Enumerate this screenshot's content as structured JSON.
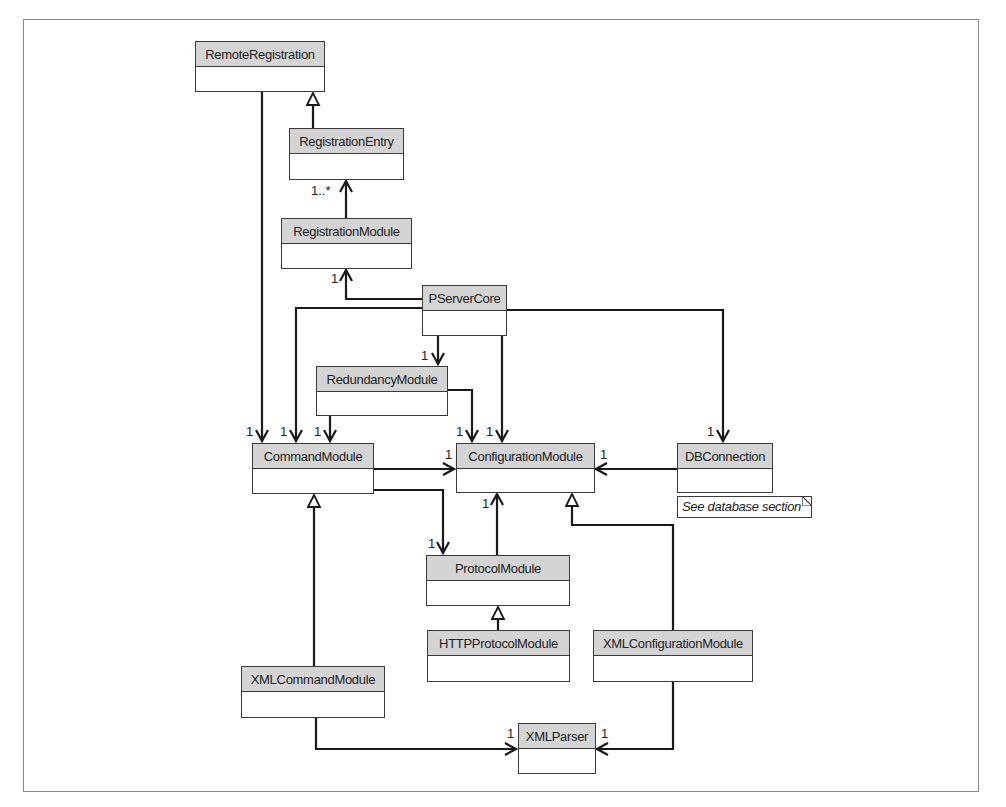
{
  "diagram": {
    "type": "uml-class-diagram",
    "classes": {
      "remote_registration": "RemoteRegistration",
      "registration_entry": "RegistrationEntry",
      "registration_module": "RegistrationModule",
      "pserver_core": "PServerCore",
      "redundancy_module": "RedundancyModule",
      "command_module": "CommandModule",
      "configuration_module": "ConfigurationModule",
      "db_connection": "DBConnection",
      "protocol_module": "ProtocolModule",
      "http_protocol_module": "HTTPProtocolModule",
      "xml_configuration_module": "XMLConfigurationModule",
      "xml_command_module": "XMLCommandModule",
      "xml_parser": "XMLParser"
    },
    "note": {
      "text": "See database section",
      "attached_to": "DBConnection"
    },
    "multiplicities": {
      "registration_entry": "1..*",
      "registration_module": "1",
      "redundancy_module": "1",
      "command_from_remote": "1",
      "command_from_core": "1",
      "command_from_redundancy": "1",
      "config_from_redundancy": "1",
      "config_from_core": "1",
      "config_from_command": "1",
      "config_from_db": "1",
      "config_from_protocol": "1",
      "db_connection": "1",
      "protocol_module": "1",
      "xml_parser_left": "1",
      "xml_parser_right": "1"
    },
    "relationships": [
      {
        "from": "RegistrationEntry",
        "to": "RemoteRegistration",
        "kind": "generalization"
      },
      {
        "from": "RegistrationModule",
        "to": "RegistrationEntry",
        "kind": "association",
        "multiplicity": "1..*"
      },
      {
        "from": "PServerCore",
        "to": "RegistrationModule",
        "kind": "association",
        "multiplicity": "1"
      },
      {
        "from": "RemoteRegistration",
        "to": "CommandModule",
        "kind": "association",
        "multiplicity": "1"
      },
      {
        "from": "PServerCore",
        "to": "CommandModule",
        "kind": "association",
        "multiplicity": "1"
      },
      {
        "from": "PServerCore",
        "to": "RedundancyModule",
        "kind": "association",
        "multiplicity": "1"
      },
      {
        "from": "PServerCore",
        "to": "ConfigurationModule",
        "kind": "association",
        "multiplicity": "1"
      },
      {
        "from": "PServerCore",
        "to": "DBConnection",
        "kind": "association",
        "multiplicity": "1"
      },
      {
        "from": "RedundancyModule",
        "to": "CommandModule",
        "kind": "association",
        "multiplicity": "1"
      },
      {
        "from": "RedundancyModule",
        "to": "ConfigurationModule",
        "kind": "association",
        "multiplicity": "1"
      },
      {
        "from": "CommandModule",
        "to": "ConfigurationModule",
        "kind": "association",
        "multiplicity": "1"
      },
      {
        "from": "CommandModule",
        "to": "ProtocolModule",
        "kind": "association",
        "multiplicity": "1"
      },
      {
        "from": "DBConnection",
        "to": "ConfigurationModule",
        "kind": "association",
        "multiplicity": "1"
      },
      {
        "from": "ProtocolModule",
        "to": "ConfigurationModule",
        "kind": "association",
        "multiplicity": "1"
      },
      {
        "from": "HTTPProtocolModule",
        "to": "ProtocolModule",
        "kind": "generalization"
      },
      {
        "from": "XMLConfigurationModule",
        "to": "ConfigurationModule",
        "kind": "generalization"
      },
      {
        "from": "XMLCommandModule",
        "to": "CommandModule",
        "kind": "generalization"
      },
      {
        "from": "XMLCommandModule",
        "to": "XMLParser",
        "kind": "association",
        "multiplicity": "1"
      },
      {
        "from": "XMLConfigurationModule",
        "to": "XMLParser",
        "kind": "association",
        "multiplicity": "1"
      }
    ]
  }
}
